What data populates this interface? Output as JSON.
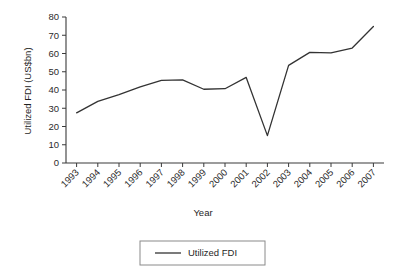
{
  "chart_data": {
    "type": "line",
    "title": "",
    "xlabel": "Year",
    "ylabel": "Utilized FDI (US$bn)",
    "categories": [
      "1993",
      "1994",
      "1995",
      "1996",
      "1997",
      "1998",
      "1999",
      "2000",
      "2001",
      "2002",
      "2003",
      "2004",
      "2005",
      "2006",
      "2007"
    ],
    "series": [
      {
        "name": "Utilized FDI",
        "values": [
          27.5,
          33.8,
          37.5,
          41.7,
          45.3,
          45.5,
          40.4,
          40.7,
          46.9,
          15.0,
          53.5,
          60.6,
          60.3,
          63.0,
          74.8
        ],
        "color": "#333333"
      }
    ],
    "ylim": [
      0,
      80
    ],
    "yticks": [
      0,
      10,
      20,
      30,
      40,
      50,
      60,
      70,
      80
    ],
    "ytick_labels": [
      "0",
      "10",
      "20",
      "30",
      "40",
      "50",
      "60",
      "70",
      "80"
    ],
    "grid": false,
    "legend_position": "bottom-center",
    "xtick_rotation": 45
  },
  "legend": {
    "entries": [
      {
        "label": "Utilized FDI"
      }
    ]
  },
  "axes": {
    "y_title": "Utilized FDI (US$bn)",
    "x_title": "Year"
  }
}
